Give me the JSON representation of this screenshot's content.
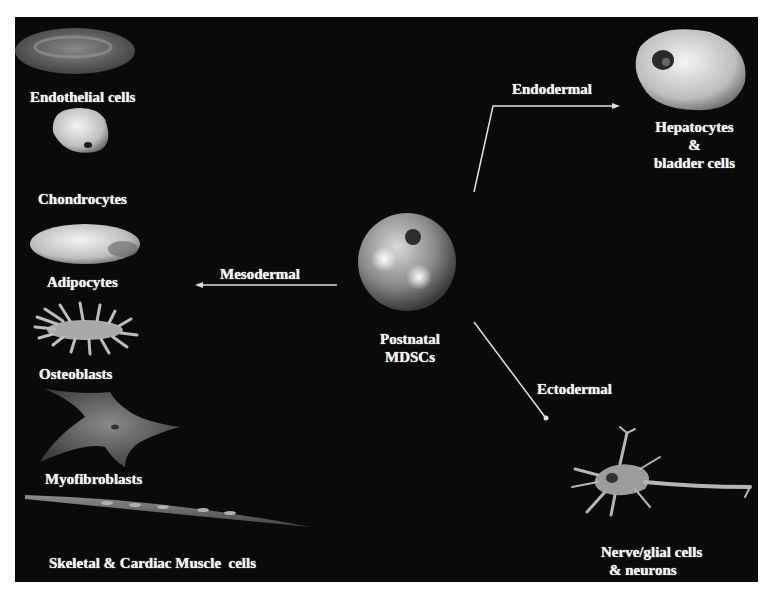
{
  "diagram": {
    "center": {
      "line1": "Postnatal",
      "line2": "MDSCs"
    },
    "branches": {
      "mesodermal": "Mesodermal",
      "endodermal": "Endodermal",
      "ectodermal": "Ectodermal"
    },
    "mesodermal_cells": [
      {
        "label": "Endothelial cells"
      },
      {
        "label": "Chondrocytes"
      },
      {
        "label": "Adipocytes"
      },
      {
        "label": "Osteoblasts"
      },
      {
        "label": "Myofibroblasts"
      },
      {
        "label": "Skeletal & Cardiac Muscle  cells"
      }
    ],
    "endodermal_cells": {
      "line1": "Hepatocytes",
      "line2": "&",
      "line3": "bladder cells"
    },
    "ectodermal_cells": {
      "line1": "Nerve/glial cells",
      "line2": "& neurons"
    },
    "colors": {
      "background": "#0a0a0a",
      "text": "#f2f2f2",
      "arrow": "#e0e0e0"
    }
  }
}
